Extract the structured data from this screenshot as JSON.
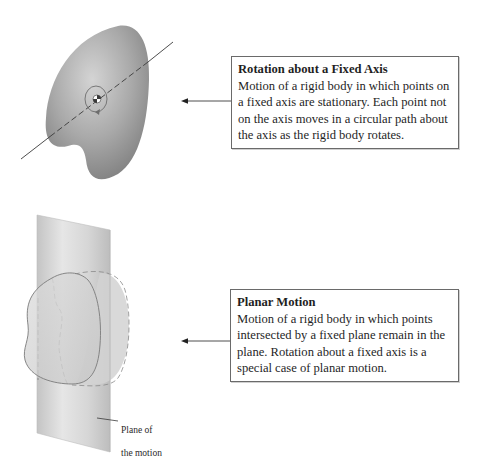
{
  "rotation_panel": {
    "title": "Rotation about a Fixed Axis",
    "body": "Motion of a rigid body in which points on a fixed axis are stationary. Each point not on the axis moves in a circular path about the axis as the rigid body rotates.",
    "figure": {
      "body_shape": "rigid-body-blob",
      "axis": "fixed-axis-line",
      "marker": "center-of-mass-marker",
      "arrow": "circular-rotation-arrow"
    }
  },
  "planar_panel": {
    "title": "Planar Motion",
    "body": "Motion of a rigid body in which points intersected by a fixed plane remain in the plane. Rotation about a fixed axis is a special case of planar motion.",
    "figure": {
      "plane_label_line1": "Plane of",
      "plane_label_line2": "the motion"
    }
  },
  "colors": {
    "body_fill_dark": "#8a8a8a",
    "body_fill_light": "#c8c8c8",
    "plane_fill": "#d8d8d8",
    "line": "#3a3a3a",
    "box_border": "#6a6a6a"
  }
}
